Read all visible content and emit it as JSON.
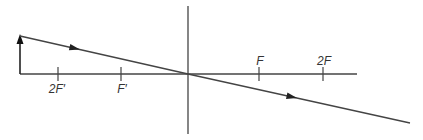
{
  "diagram": {
    "type": "ray-diagram-converging-lens",
    "colors": {
      "line": "#444444",
      "text": "#333333",
      "background": "#ffffff"
    },
    "optical_axis": {
      "x1": 20,
      "x2": 357,
      "y": 74
    },
    "lens": {
      "x": 188,
      "y1": 6,
      "y2": 134
    },
    "object": {
      "x": 20,
      "base_y": 74,
      "tip_y": 36
    },
    "ray": {
      "points": [
        [
          20,
          36
        ],
        [
          188,
          74
        ],
        [
          410,
          123
        ]
      ],
      "arrowheads": [
        [
          75,
          48
        ],
        [
          292,
          97
        ]
      ]
    },
    "focal_marks": [
      {
        "id": "2F-prime",
        "label": "2F′",
        "x": 58
      },
      {
        "id": "F-prime",
        "label": "F′",
        "x": 121
      },
      {
        "id": "F",
        "label": "F",
        "x": 259
      },
      {
        "id": "2F",
        "label": "2F",
        "x": 323
      }
    ]
  }
}
